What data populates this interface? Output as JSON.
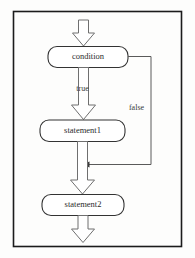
{
  "diagram": {
    "type": "flowchart",
    "frame": {
      "border_color": "#1b1b1b",
      "background": "#fdfdfc"
    },
    "nodes": [
      {
        "id": "condition",
        "label": "condition",
        "shape": "rounded-rectangle"
      },
      {
        "id": "statement1",
        "label": "statement1",
        "shape": "rounded-rectangle"
      },
      {
        "id": "statement2",
        "label": "statement2",
        "shape": "rounded-rectangle"
      }
    ],
    "edges": [
      {
        "id": "entry",
        "from": "",
        "to": "condition",
        "label": "",
        "style": "block-arrow"
      },
      {
        "id": "condition-true",
        "from": "condition",
        "to": "statement1",
        "label": "true",
        "style": "block-arrow"
      },
      {
        "id": "condition-false",
        "from": "condition",
        "to": "loop-join",
        "label": "false",
        "style": "thin-line"
      },
      {
        "id": "statement1-next",
        "from": "statement1",
        "to": "statement2",
        "label": "",
        "style": "block-arrow"
      },
      {
        "id": "exit",
        "from": "statement2",
        "to": "",
        "label": "",
        "style": "block-arrow"
      }
    ],
    "labels": {
      "entry_arrow": "entry-arrow",
      "true_branch": "true",
      "false_branch": "false",
      "exit_arrow": "exit-arrow"
    }
  }
}
